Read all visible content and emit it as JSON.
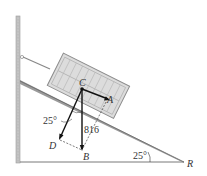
{
  "diagram": {
    "type": "statics-incline-crate",
    "points": {
      "C": "C",
      "A": "A",
      "D": "D",
      "B": "B",
      "R": "R"
    },
    "labels": {
      "angle_force": "25°",
      "angle_incline": "25°",
      "force_magnitude": "816"
    },
    "colors": {
      "crate_fill": "#d9d9d9",
      "crate_stroke": "#8c8c8c",
      "incline_fill": "#bdbdbd",
      "vector": "#111111",
      "wall": "#b0b0b0"
    }
  }
}
